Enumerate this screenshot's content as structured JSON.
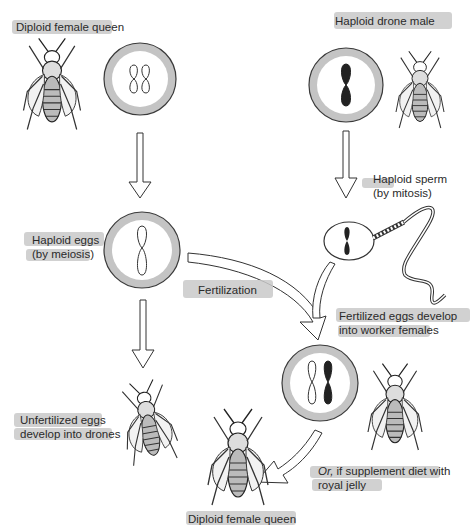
{
  "diagram": {
    "colors": {
      "background": "#ffffff",
      "label_highlight": "#c9c9c9",
      "cell_ring": "#c4c4c4",
      "outline": "#3a3a3a",
      "paternal_chromosome": "#222222"
    },
    "nodes": {
      "queen_parent": {
        "label": "Diploid female queen",
        "ploidy": "2n",
        "chromosomes": [
          "maternal",
          "maternal"
        ]
      },
      "drone_parent": {
        "label": "Haploid drone male",
        "ploidy": "n",
        "chromosomes": [
          "paternal"
        ]
      },
      "eggs": {
        "label_line1": "Haploid eggs",
        "label_line2": "(by meiosis)",
        "ploidy": "n",
        "chromosomes": [
          "maternal"
        ]
      },
      "sperm": {
        "label_line1": "Haploid sperm",
        "label_line2": "(by mitosis)",
        "ploidy": "n",
        "chromosomes": [
          "paternal"
        ]
      },
      "fertilization": {
        "label": "Fertilization"
      },
      "worker": {
        "label_line1": "Fertilized eggs develop",
        "label_line2": "into worker females",
        "ploidy": "2n",
        "chromosomes": [
          "maternal",
          "paternal"
        ]
      },
      "drone_offspring": {
        "label_line1": "Unfertilized eggs",
        "label_line2": "develop into drones"
      },
      "royal_jelly": {
        "label_prefix": "Or,",
        "label_line1_rest": " if supplement diet with",
        "label_line2": "royal jelly"
      },
      "queen_offspring": {
        "label": "Diploid female queen"
      }
    },
    "edges": [
      {
        "from": "queen_parent",
        "to": "eggs",
        "style": "hollow-arrow"
      },
      {
        "from": "drone_parent",
        "to": "sperm",
        "style": "hollow-arrow"
      },
      {
        "from": "eggs",
        "to": "drone_offspring",
        "style": "hollow-arrow"
      },
      {
        "from": "eggs",
        "to": "worker",
        "style": "curved-hollow-arrow",
        "label": "Fertilization"
      },
      {
        "from": "sperm",
        "to": "worker",
        "style": "curved-hollow-arrow"
      },
      {
        "from": "worker",
        "to": "queen_offspring",
        "style": "curved-hollow-arrow",
        "label": "Or, if supplement diet with royal jelly"
      }
    ]
  }
}
